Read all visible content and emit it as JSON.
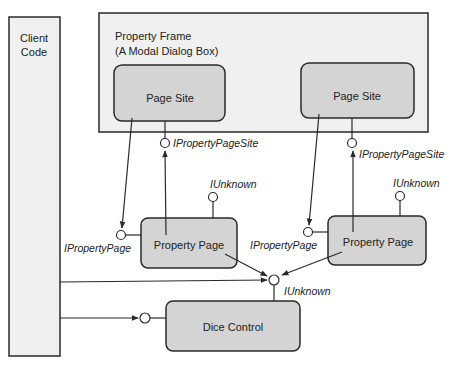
{
  "diagram": {
    "colors": {
      "background": "#ffffff",
      "container_fill": "#f0f0f0",
      "component_fill": "#d4d4d4",
      "stroke": "#2a2a2a"
    },
    "client": {
      "line1": "Client",
      "line2": "Code"
    },
    "frame": {
      "line1": "Property Frame",
      "line2": "(A Modal Dialog Box)"
    },
    "page_site_left": {
      "label": "Page Site"
    },
    "page_site_right": {
      "label": "Page Site"
    },
    "property_page_left": {
      "label": "Property Page"
    },
    "property_page_right": {
      "label": "Property Page"
    },
    "dice_control": {
      "label": "Dice Control"
    },
    "interfaces": {
      "ipps_left": "IPropertyPageSite",
      "ipps_right": "IPropertyPageSite",
      "iunk_pp_left": "IUnknown",
      "iunk_pp_right": "IUnknown",
      "ipp_left": "IPropertyPage",
      "ipp_right": "IPropertyPage",
      "iunk_dice": "IUnknown"
    }
  }
}
